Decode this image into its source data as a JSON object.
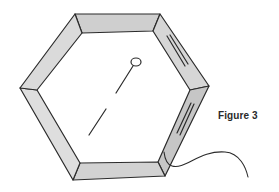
{
  "figure": {
    "caption": "Figure 3"
  },
  "colors": {
    "stroke": "#2b2b2b",
    "frame_fill": "#d9d9d9",
    "frame_fill_dark": "#c9c9c9",
    "background": "#ffffff"
  }
}
